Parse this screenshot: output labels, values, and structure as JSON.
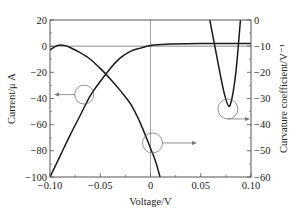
{
  "chart_data": {
    "type": "line",
    "title": "",
    "xlabel": "Voltage/V",
    "ylabel": "Current/μ A",
    "y2label": "Curvature coefficient/V⁻¹",
    "xlim": [
      -0.1,
      0.1
    ],
    "ylim": [
      -100,
      20
    ],
    "y2lim": [
      -60,
      0
    ],
    "x_ticks": [
      -0.1,
      -0.05,
      0,
      0.05,
      0.1
    ],
    "x_tick_labels": [
      "−0.10",
      "−0.05",
      "0",
      "0.05",
      "0.10"
    ],
    "y_ticks": [
      20,
      0,
      -20,
      -40,
      -60,
      -80,
      -100
    ],
    "y_tick_labels": [
      "20",
      "0",
      "−20",
      "−40",
      "−60",
      "−80",
      "−100"
    ],
    "y2_ticks": [
      0,
      -10,
      -20,
      -30,
      -40,
      -50,
      -60
    ],
    "y2_tick_labels": [
      "0",
      "−10",
      "−20",
      "−30",
      "−40",
      "−50",
      "−60"
    ],
    "grid": false,
    "reference_lines": {
      "y_zero": 0,
      "x_zero": 0
    },
    "series": [
      {
        "name": "Current",
        "axis": "left",
        "x": [
          -0.1,
          -0.09,
          -0.08,
          -0.07,
          -0.06,
          -0.05,
          -0.04,
          -0.03,
          -0.02,
          -0.01,
          0.0,
          0.01,
          0.02,
          0.05,
          0.1
        ],
        "values": [
          -100,
          -84,
          -68,
          -53,
          -38,
          -27,
          -17,
          -9,
          -4,
          -1.5,
          0.5,
          1.2,
          1.6,
          2,
          2
        ]
      },
      {
        "name": "Curvature coefficient (branch 1)",
        "axis": "right",
        "x": [
          -0.1,
          -0.095,
          -0.09,
          -0.085,
          -0.08,
          -0.07,
          -0.06,
          -0.05,
          -0.04,
          -0.03,
          -0.02,
          -0.01,
          0.0,
          0.005,
          0.0095
        ],
        "values": [
          -11.5,
          -10.2,
          -9.6,
          -9.8,
          -10.5,
          -12.5,
          -15,
          -18.5,
          -22.5,
          -27,
          -32,
          -39.5,
          -49,
          -54,
          -60
        ]
      },
      {
        "name": "Curvature coefficient (branch 2)",
        "axis": "right",
        "x": [
          0.059,
          0.062,
          0.066,
          0.07,
          0.074,
          0.078,
          0.081,
          0.084,
          0.086,
          0.088,
          0.0895
        ],
        "values": [
          0,
          -6,
          -14,
          -22,
          -29,
          -33,
          -30,
          -23,
          -16,
          -7,
          0
        ]
      }
    ],
    "annotations": [
      {
        "type": "circle-arrow",
        "target_series": "Current",
        "circle_center": [
          -0.066,
          -37
        ],
        "arrow_direction": "left",
        "meaning": "read on left axis"
      },
      {
        "type": "circle-arrow",
        "target_series": "Curvature coefficient (branch 1)",
        "circle_center": [
          0.002,
          -47
        ],
        "arrow_direction": "right",
        "meaning": "read on right axis"
      },
      {
        "type": "circle-arrow",
        "target_series": "Curvature coefficient (branch 2)",
        "circle_center": [
          0.077,
          -34
        ],
        "arrow_direction": "right",
        "meaning": "read on right axis"
      }
    ],
    "legend": null
  },
  "colors": {
    "curve": "#1a1a1a",
    "frame": "#555555",
    "reference": "#8a8a8a",
    "annotation": "#777777"
  }
}
